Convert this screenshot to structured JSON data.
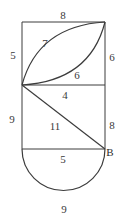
{
  "figure": {
    "type": "geometry-diagram",
    "background_color": "#ffffff",
    "stroke_color": "#3c3c3c",
    "label_color": "#3a3a3a",
    "labels": {
      "top_edge": "8",
      "upper_left_edge": "5",
      "upper_right_edge": "6",
      "upper_arc": "7",
      "lower_arc": "6",
      "middle_edge": "4",
      "lower_left_edge": "9",
      "lower_right_edge": "8",
      "diagonal": "11",
      "bottom_edge": "5",
      "semicircle": "9",
      "point_b": "B"
    },
    "label_positions": {
      "top_edge": {
        "x": 63,
        "y": 15
      },
      "upper_left_edge": {
        "x": 13,
        "y": 55
      },
      "upper_right_edge": {
        "x": 112,
        "y": 57
      },
      "upper_arc": {
        "x": 45,
        "y": 43
      },
      "lower_arc": {
        "x": 77,
        "y": 75
      },
      "middle_edge": {
        "x": 65,
        "y": 95
      },
      "lower_left_edge": {
        "x": 12,
        "y": 119
      },
      "lower_right_edge": {
        "x": 112,
        "y": 125
      },
      "diagonal": {
        "x": 55,
        "y": 126
      },
      "bottom_edge": {
        "x": 63,
        "y": 159
      },
      "semicircle": {
        "x": 64,
        "y": 209
      },
      "point_b": {
        "x": 110,
        "y": 152
      }
    },
    "geometry": {
      "rect_left_x": 22,
      "rect_right_x": 105,
      "top_y": 22,
      "middle_y": 85,
      "bottom_y": 149,
      "semicircle_bottom_y": 200
    }
  }
}
